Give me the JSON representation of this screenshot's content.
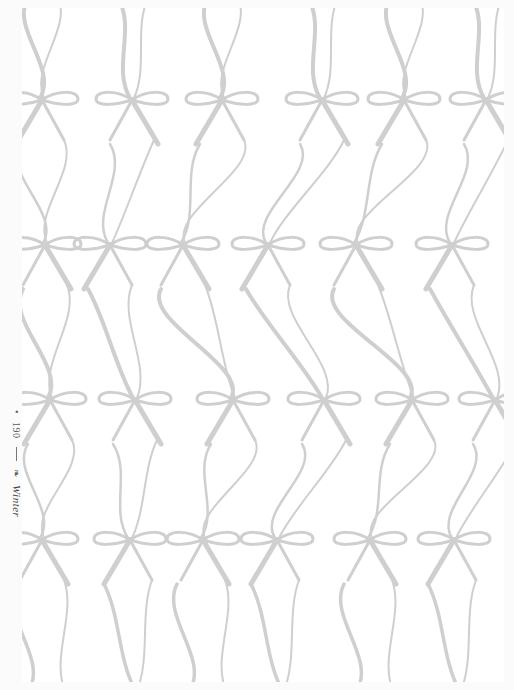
{
  "page": {
    "background_color": "#fbfbfb",
    "panel_color": "#ffffff",
    "ribbon_color": "#cfcfcf"
  },
  "folio": {
    "bullet": "•",
    "page_number": "190",
    "separator": "|",
    "ornament": "❧",
    "section": "Winter"
  },
  "pattern": {
    "description": "Repeating gray ribbon bows with long wavy tails",
    "rows": [
      {
        "y": 92,
        "bows_x": [
          20,
          110,
          200,
          300,
          382,
          464
        ]
      },
      {
        "y": 237,
        "bows_x": [
          23,
          88,
          161,
          246,
          334,
          430
        ]
      },
      {
        "y": 392,
        "bows_x": [
          28,
          113,
          211,
          302,
          390,
          473
        ]
      },
      {
        "y": 532,
        "bows_x": [
          20,
          108,
          181,
          255,
          348,
          432
        ]
      }
    ]
  }
}
